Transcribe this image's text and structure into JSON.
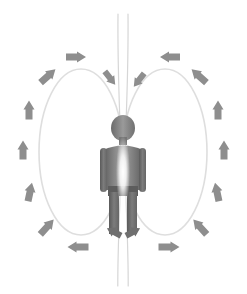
{
  "diagram": {
    "width": 247,
    "height": 294,
    "background_color": "#ffffff"
  },
  "colors": {
    "background": "#ffffff",
    "figure_dark": "#5d5d5d",
    "figure_mid": "#767676",
    "figure_light": "#9b9b9b",
    "arrow": "#8e8e8e",
    "arrow_dark": "#7a7a7a",
    "loop_line": "#dedede",
    "axis_line": "#d6d6d6",
    "glow": "#ffffff"
  },
  "figure": {
    "name": "human-silhouette",
    "center_x": 123,
    "head_cy": 128,
    "head_rx": 12,
    "head_ry": 13,
    "body_top": 143,
    "body_bottom": 232,
    "glow_label": "central-body-glow"
  },
  "axis": {
    "name": "central-vertical-axis",
    "label": "central axis",
    "x_left": 118,
    "x_right": 128,
    "top": 14,
    "bottom": 286,
    "stroke_width": 1.2
  },
  "loops": [
    {
      "name": "left-field-loop",
      "label": "left loop",
      "cx": 81,
      "cy": 152,
      "rx": 42,
      "ry": 83
    },
    {
      "name": "right-field-loop",
      "label": "right loop",
      "cx": 165,
      "cy": 152,
      "rx": 42,
      "ry": 83
    }
  ],
  "arrows": [
    {
      "id": 1,
      "name": "arrow-top-left-horizontal",
      "x": 76,
      "y": 57,
      "angle": 0,
      "len": 20,
      "w": 7,
      "head": 9,
      "shade": "#8e8e8e",
      "direction": "right"
    },
    {
      "id": 2,
      "name": "arrow-upper-left-diagonal",
      "x": 48,
      "y": 76,
      "angle": -42,
      "len": 20,
      "w": 7,
      "head": 9,
      "shade": "#8e8e8e",
      "direction": "up-right"
    },
    {
      "id": 3,
      "name": "arrow-left-upper-vertical",
      "x": 29,
      "y": 110,
      "angle": -90,
      "len": 19,
      "w": 7,
      "head": 9,
      "shade": "#8e8e8e",
      "direction": "up"
    },
    {
      "id": 4,
      "name": "arrow-left-mid-vertical",
      "x": 23,
      "y": 150,
      "angle": -90,
      "len": 19,
      "w": 7,
      "head": 9,
      "shade": "#8e8e8e",
      "direction": "up"
    },
    {
      "id": 5,
      "name": "arrow-left-lower-vertical",
      "x": 30,
      "y": 192,
      "angle": -78,
      "len": 19,
      "w": 7,
      "head": 9,
      "shade": "#8e8e8e",
      "direction": "up"
    },
    {
      "id": 6,
      "name": "arrow-lower-left-diagonal",
      "x": 47,
      "y": 227,
      "angle": -48,
      "len": 20,
      "w": 7,
      "head": 9,
      "shade": "#8e8e8e",
      "direction": "up-right"
    },
    {
      "id": 7,
      "name": "arrow-bottom-left-horizontal",
      "x": 78,
      "y": 247,
      "angle": 180,
      "len": 21,
      "w": 7,
      "head": 9,
      "shade": "#8e8e8e",
      "direction": "left"
    },
    {
      "id": 8,
      "name": "arrow-top-right-horizontal",
      "x": 170,
      "y": 57,
      "angle": 180,
      "len": 20,
      "w": 7,
      "head": 9,
      "shade": "#8e8e8e",
      "direction": "left"
    },
    {
      "id": 9,
      "name": "arrow-upper-right-diagonal",
      "x": 199,
      "y": 76,
      "angle": -138,
      "len": 20,
      "w": 7,
      "head": 9,
      "shade": "#8e8e8e",
      "direction": "up-left"
    },
    {
      "id": 10,
      "name": "arrow-right-upper-vertical",
      "x": 218,
      "y": 110,
      "angle": -90,
      "len": 19,
      "w": 7,
      "head": 9,
      "shade": "#8e8e8e",
      "direction": "up"
    },
    {
      "id": 11,
      "name": "arrow-right-mid-vertical",
      "x": 224,
      "y": 150,
      "angle": -90,
      "len": 19,
      "w": 7,
      "head": 9,
      "shade": "#8e8e8e",
      "direction": "up"
    },
    {
      "id": 12,
      "name": "arrow-right-lower-vertical",
      "x": 217,
      "y": 192,
      "angle": -102,
      "len": 19,
      "w": 7,
      "head": 9,
      "shade": "#8e8e8e",
      "direction": "up"
    },
    {
      "id": 13,
      "name": "arrow-lower-right-diagonal",
      "x": 200,
      "y": 227,
      "angle": -132,
      "len": 20,
      "w": 7,
      "head": 9,
      "shade": "#8e8e8e",
      "direction": "up-left"
    },
    {
      "id": 14,
      "name": "arrow-bottom-right-horizontal",
      "x": 169,
      "y": 247,
      "angle": 0,
      "len": 21,
      "w": 7,
      "head": 9,
      "shade": "#8e8e8e",
      "direction": "right"
    },
    {
      "id": 15,
      "name": "arrow-inflow-head-left",
      "x": 110,
      "y": 78,
      "angle": 52,
      "len": 17,
      "w": 6,
      "head": 8,
      "shade": "#8e8e8e",
      "direction": "down-right"
    },
    {
      "id": 16,
      "name": "arrow-inflow-head-right",
      "x": 139,
      "y": 80,
      "angle": 128,
      "len": 17,
      "w": 6,
      "head": 8,
      "shade": "#8e8e8e",
      "direction": "down-left"
    },
    {
      "id": 17,
      "name": "arrow-outflow-feet-left",
      "x": 114,
      "y": 232,
      "angle": 208,
      "len": 16,
      "w": 6,
      "head": 8,
      "shade": "#6f6f6f",
      "direction": "down-left"
    },
    {
      "id": 18,
      "name": "arrow-outflow-feet-right",
      "x": 133,
      "y": 232,
      "angle": -28,
      "len": 16,
      "w": 6,
      "head": 8,
      "shade": "#6f6f6f",
      "direction": "down-right"
    }
  ],
  "flow": {
    "label": "field circulation",
    "path_description": "down the central axis, out at the feet, around the loops, back in at the head"
  }
}
